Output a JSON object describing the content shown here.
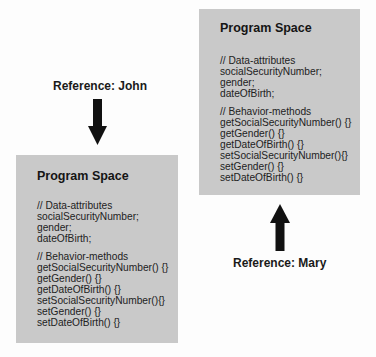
{
  "diagram": {
    "references": [
      {
        "label": "Reference: John",
        "arrow_direction": "down",
        "arrow_icon": "arrow-down-icon"
      },
      {
        "label": "Reference: Mary",
        "arrow_direction": "up",
        "arrow_icon": "arrow-up-icon"
      }
    ],
    "boxes": [
      {
        "owner": "John",
        "title": "Program Space",
        "attributes_comment": "// Data-attributes",
        "attributes": [
          "socialSecurityNumber;",
          "gender;",
          "dateOfBirth;"
        ],
        "methods_comment": "// Behavior-methods",
        "methods": [
          "getSocialSecurityNumber() {}",
          "getGender() {}",
          "getDateOfBirth() {}",
          "setSocialSecurityNumber(){}",
          "setGender() {}",
          "setDateOfBirth() {}"
        ]
      },
      {
        "owner": "Mary",
        "title": "Program Space",
        "attributes_comment": "// Data-attributes",
        "attributes": [
          "socialSecurityNumber;",
          "gender;",
          "dateOfBirth;"
        ],
        "methods_comment": "// Behavior-methods",
        "methods": [
          "getSocialSecurityNumber() {}",
          "getGender() {}",
          "getDateOfBirth() {}",
          "setSocialSecurityNumber(){}",
          "setGender() {}",
          "setDateOfBirth() {}"
        ]
      }
    ],
    "colors": {
      "box_fill": "#c9c9c9",
      "arrow": "#111111",
      "text": "#1a1a1a",
      "background": "#fdfdfd"
    }
  }
}
